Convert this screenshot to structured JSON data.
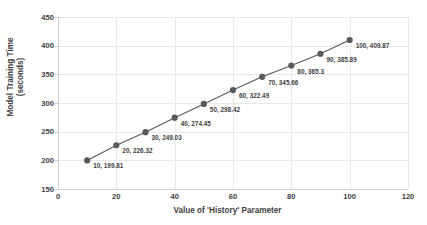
{
  "chart_data": {
    "type": "scatter",
    "title": "",
    "xlabel": "Value of 'History' Parameter",
    "ylabel": "Model Training Time (seconds)",
    "ylabel_line1": "Model Training Time",
    "ylabel_line2": "(seconds)",
    "xlim": [
      0,
      120
    ],
    "ylim": [
      150,
      450
    ],
    "xticks": [
      0,
      20,
      40,
      60,
      80,
      100,
      120
    ],
    "yticks": [
      150,
      200,
      250,
      300,
      350,
      400,
      450
    ],
    "xtick_labels": [
      "0",
      "20",
      "40",
      "60",
      "80",
      "100",
      "120"
    ],
    "ytick_labels": [
      "150",
      "200",
      "250",
      "300",
      "350",
      "400",
      "450"
    ],
    "grid": true,
    "legend": "none",
    "series_color": "#595959",
    "gridline_color": "#E8E8E8",
    "x": [
      10,
      20,
      30,
      40,
      50,
      60,
      70,
      80,
      90,
      100
    ],
    "y": [
      199.81,
      226.32,
      249.03,
      274.45,
      298.42,
      322.49,
      345.66,
      365.3,
      385.89,
      409.87
    ],
    "point_labels": [
      "10, 199.81",
      "20, 226.32",
      "30, 249.03",
      "40, 274.45",
      "50, 298.42",
      "60, 322.49",
      "70, 345.66",
      "80, 365.3",
      "90, 385.89",
      "100, 409.87"
    ]
  }
}
